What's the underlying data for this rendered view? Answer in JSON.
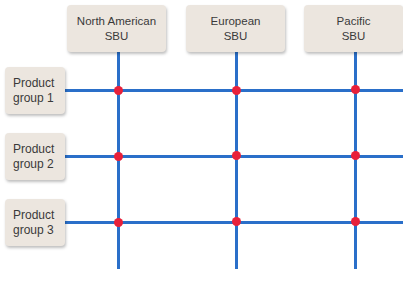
{
  "diagram": {
    "type": "matrix organization",
    "colors": {
      "line": "#2a6fc9",
      "node": "#e8203a",
      "box": "#ece6df",
      "text": "#3a3a3a"
    },
    "columns": [
      {
        "line1": "North American",
        "line2": "SBU"
      },
      {
        "line1": "European",
        "line2": "SBU"
      },
      {
        "line1": "Pacific",
        "line2": "SBU"
      }
    ],
    "rows": [
      {
        "line1": "Product",
        "line2": "group 1"
      },
      {
        "line1": "Product",
        "line2": "group 2"
      },
      {
        "line1": "Product",
        "line2": "group 3"
      }
    ]
  }
}
